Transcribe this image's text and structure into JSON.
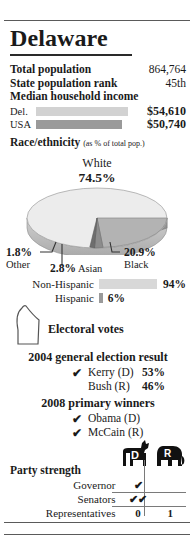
{
  "title": "Delaware",
  "stats": [
    {
      "label": "Total population",
      "value": "864,764"
    },
    {
      "label": "State population rank",
      "value": "45th"
    }
  ],
  "income": {
    "heading": "Median household income",
    "rows": [
      {
        "name": "Del.",
        "amount": "$54,610",
        "value": 54610,
        "bar_color": "#d2d2d2"
      },
      {
        "name": "USA",
        "amount": "$50,740",
        "value": 50740,
        "bar_color": "#9a9a9a"
      }
    ]
  },
  "race": {
    "heading": "Race/ethnicity",
    "caption": "(as % of total pop.)",
    "center_label": "White",
    "center_pct": "74.5%",
    "slices": [
      {
        "name": "White",
        "pct": "74.5%",
        "value": 74.5,
        "color": "#ececec"
      },
      {
        "name": "Black",
        "pct": "20.9%",
        "value": 20.9,
        "color": "#b3b3b3"
      },
      {
        "name": "Asian",
        "pct": "2.8%",
        "value": 2.8,
        "color": "#8c8c8c"
      },
      {
        "name": "Other",
        "pct": "1.8%",
        "value": 1.8,
        "color": "#6e6e6e"
      }
    ]
  },
  "hispanic": {
    "rows": [
      {
        "name": "Non-Hispanic",
        "pct": "94%",
        "value": 94,
        "bar_color": "#d8d8d8"
      },
      {
        "name": "Hispanic",
        "pct": "6%",
        "value": 6,
        "bar_color": "#9a9a9a"
      }
    ]
  },
  "electoral": {
    "count": "3",
    "label": "Electoral votes"
  },
  "general_election": {
    "heading": "2004 general election result",
    "candidates": [
      {
        "name": "Kerry (D)",
        "pct": "53%",
        "winner": true,
        "check": "✔"
      },
      {
        "name": "Bush (R)",
        "pct": "46%",
        "winner": false,
        "check": ""
      }
    ]
  },
  "primary": {
    "heading": "2008 primary winners",
    "winners": [
      {
        "name": "Obama (D)",
        "check": "✔"
      },
      {
        "name": "McCain (R)",
        "check": "✔"
      }
    ]
  },
  "party_strength": {
    "heading": "Party strength",
    "columns": [
      {
        "key": "D",
        "icon": "donkey-icon",
        "letter": "D"
      },
      {
        "key": "R",
        "icon": "elephant-icon",
        "letter": "R"
      }
    ],
    "rows": [
      {
        "label": "Governor",
        "D": "✔",
        "R": ""
      },
      {
        "label": "Senators",
        "D": "✔✔",
        "R": ""
      },
      {
        "label": "Representatives",
        "D": "0",
        "R": "1"
      }
    ]
  },
  "chart_data": [
    {
      "type": "bar",
      "title": "Median household income",
      "categories": [
        "Del.",
        "USA"
      ],
      "values": [
        54610,
        50740
      ],
      "labels": [
        "$54,610",
        "$50,740"
      ],
      "xlabel": "",
      "ylabel": "",
      "orientation": "horizontal",
      "grid": false,
      "legend": false
    },
    {
      "type": "pie",
      "title": "Race/ethnicity (as % of total pop.)",
      "categories": [
        "White",
        "Black",
        "Asian",
        "Other"
      ],
      "values": [
        74.5,
        20.9,
        2.8,
        1.8
      ],
      "labels": [
        "74.5%",
        "20.9%",
        "2.8%",
        "1.8%"
      ],
      "legend": false
    },
    {
      "type": "bar",
      "title": "Hispanic origin",
      "categories": [
        "Non-Hispanic",
        "Hispanic"
      ],
      "values": [
        94,
        6
      ],
      "labels": [
        "94%",
        "6%"
      ],
      "orientation": "horizontal",
      "grid": false,
      "legend": false
    },
    {
      "type": "bar",
      "title": "2004 general election result",
      "categories": [
        "Kerry (D)",
        "Bush (R)"
      ],
      "values": [
        53,
        46
      ],
      "labels": [
        "53%",
        "46%"
      ],
      "orientation": "horizontal",
      "grid": false,
      "legend": false
    },
    {
      "type": "table",
      "title": "Party strength",
      "columns": [
        "",
        "D",
        "R"
      ],
      "rows": [
        [
          "Governor",
          "✔",
          ""
        ],
        [
          "Senators",
          "✔✔",
          ""
        ],
        [
          "Representatives",
          "0",
          "1"
        ]
      ]
    }
  ]
}
